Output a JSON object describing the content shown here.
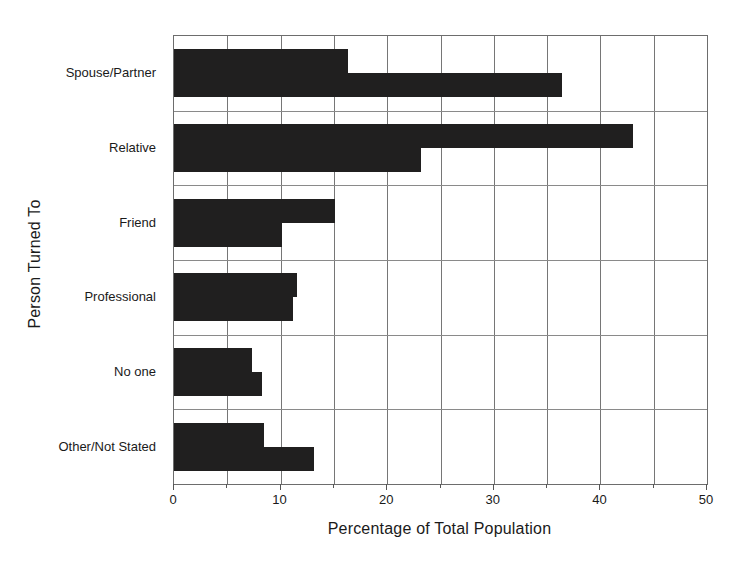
{
  "chart_data": {
    "type": "bar",
    "orientation": "horizontal",
    "title": "",
    "xlabel": "Percentage of Total Population",
    "ylabel": "Person Turned To",
    "categories": [
      "Spouse/Partner",
      "Relative",
      "Friend",
      "Professional",
      "No one",
      "Other/Not Stated"
    ],
    "series": [
      {
        "name": "Series 1",
        "values": [
          16.3,
          43.1,
          15.1,
          11.5,
          7.3,
          8.4
        ]
      },
      {
        "name": "Series 2",
        "values": [
          36.4,
          23.2,
          10.1,
          11.2,
          8.3,
          13.1
        ]
      }
    ],
    "xlim": [
      0,
      50
    ],
    "xticks": [
      0,
      10,
      20,
      30,
      40,
      50
    ],
    "xtick_labels": [
      "0",
      "10",
      "20",
      "30",
      "40",
      "50"
    ],
    "minor_xticks": [
      5,
      15,
      25,
      35,
      45
    ],
    "grid": true,
    "legend": "none",
    "bar_color": "#201f1f",
    "grid_color": "#767676",
    "frame_color": "#6d6d6d"
  }
}
